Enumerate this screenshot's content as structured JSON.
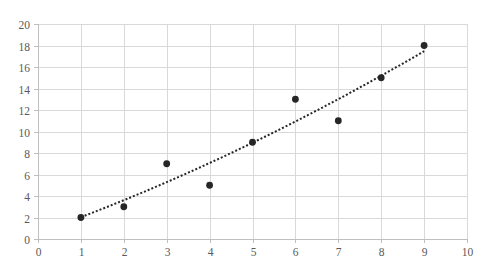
{
  "chart_data": {
    "type": "scatter",
    "title": "",
    "xlabel": "",
    "ylabel": "",
    "xlim": [
      0,
      10
    ],
    "ylim": [
      0,
      20
    ],
    "x_ticks": [
      0,
      1,
      2,
      3,
      4,
      5,
      6,
      7,
      8,
      9,
      10
    ],
    "y_ticks": [
      0,
      2,
      4,
      6,
      8,
      10,
      12,
      14,
      16,
      18,
      20
    ],
    "grid": true,
    "legend": null,
    "series": [
      {
        "name": "Series1",
        "x": [
          1,
          2,
          3,
          4,
          5,
          6,
          7,
          8,
          9
        ],
        "y": [
          2,
          3,
          7,
          5,
          9,
          13,
          11,
          15,
          18
        ],
        "marker_color": "#262626"
      }
    ],
    "trendline": {
      "type": "polynomial",
      "order": 2,
      "style": "dotted",
      "color": "#262626",
      "coefficients": {
        "a": 0.05,
        "b": 1.43,
        "c": 0.55
      },
      "x_range": [
        1,
        9
      ]
    }
  },
  "colors": {
    "grid": "#d9d9d9",
    "axis": "#bfbfbf",
    "tick_text": "#595959",
    "marker": "#262626"
  },
  "layout": {
    "plot_left": 38,
    "plot_right": 467,
    "plot_top": 24,
    "plot_bottom": 239
  }
}
